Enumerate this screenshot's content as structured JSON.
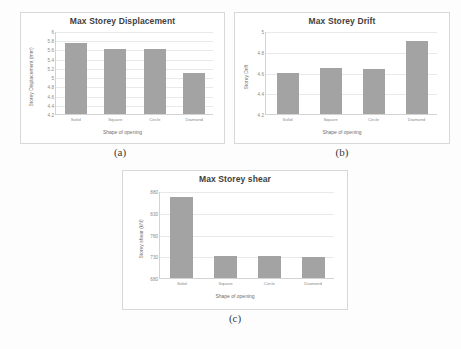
{
  "figure": {
    "background_color": "#fdfdfd",
    "bar_color": "#a3a3a3",
    "panel_captions": {
      "a": "(a)",
      "b": "(b)",
      "c": "(c)"
    }
  },
  "chart_data": [
    {
      "type": "bar",
      "panel": "(a)",
      "title": "Max Storey Displacement",
      "xlabel": "Shape of opening",
      "ylabel": "Storey Displacement (mm)",
      "categories": [
        "Solid",
        "Square",
        "Circle",
        "Diamond"
      ],
      "values": [
        5.75,
        5.6,
        5.6,
        5.1
      ],
      "ylim": [
        4.2,
        6.0
      ],
      "yticks": [
        4.2,
        4.4,
        4.6,
        4.8,
        5.0,
        5.2,
        5.4,
        5.6,
        5.8,
        6.0
      ],
      "ytick_labels": [
        "4.2",
        "4.4",
        "4.6",
        "4.8",
        "5",
        "5.2",
        "5.4",
        "5.6",
        "5.8",
        "6"
      ],
      "grid": true,
      "legend": "none"
    },
    {
      "type": "bar",
      "panel": "(b)",
      "title": "Max Storey Drift",
      "xlabel": "Shape of opening",
      "ylabel": "Storey Drift",
      "categories": [
        "Solid",
        "Square",
        "Circle",
        "Diamond"
      ],
      "values": [
        4.6,
        4.64,
        4.63,
        4.9
      ],
      "ylim": [
        4.2,
        5.0
      ],
      "yticks": [
        4.2,
        4.4,
        4.6,
        4.8,
        5.0
      ],
      "ytick_labels": [
        "4.2",
        "4.4",
        "4.6",
        "4.8",
        "5"
      ],
      "grid": true,
      "legend": "none"
    },
    {
      "type": "bar",
      "panel": "(c)",
      "title": "Max Storey shear",
      "xlabel": "Shape of opening",
      "ylabel": "Storey shear (kN)",
      "categories": [
        "Solid",
        "Square",
        "Circle",
        "Diamond"
      ],
      "values": [
        866,
        731,
        731,
        728
      ],
      "ylim": [
        680,
        880
      ],
      "yticks": [
        680,
        730,
        780,
        830,
        880
      ],
      "ytick_labels": [
        "680",
        "730",
        "780",
        "830",
        "880"
      ],
      "grid": true,
      "legend": "none"
    }
  ]
}
